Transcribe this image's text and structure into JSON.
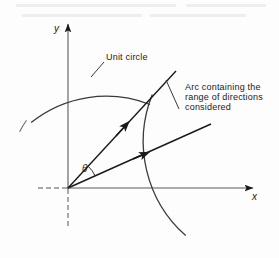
{
  "figure": {
    "type": "geometry-diagram",
    "background_color": "#fdfdfd",
    "stroke_color": "#1a1a1a",
    "width": 279,
    "height": 258,
    "origin": {
      "x": 68,
      "y": 188
    }
  },
  "axes": {
    "x_label": "x",
    "y_label": "y",
    "x_axis": {
      "from_x": 38,
      "to_x": 258,
      "y": 188,
      "dashed_left_of_origin": true,
      "arrow": "right"
    },
    "y_axis": {
      "x": 68,
      "from_y": 225,
      "to_y": 18,
      "dashed_below_origin": true,
      "arrow": "up"
    }
  },
  "angle": {
    "symbol": "θ",
    "between_rays": [
      "ray-upper",
      "ray-lower"
    ],
    "vertex": {
      "x": 68,
      "y": 188
    }
  },
  "rays": [
    {
      "name": "ray-upper",
      "from": {
        "x": 68,
        "y": 188
      },
      "to": {
        "x": 176,
        "y": 71
      },
      "arrow_at": {
        "x": 123,
        "y": 135
      },
      "angle_deg": 47
    },
    {
      "name": "ray-lower",
      "from": {
        "x": 68,
        "y": 188
      },
      "to": {
        "x": 211,
        "y": 124
      },
      "arrow_at": {
        "x": 141,
        "y": 156
      },
      "angle_deg": 24
    }
  ],
  "arcs": [
    {
      "name": "unit-circle-arc",
      "label": "Unit circle",
      "center": {
        "x": 68,
        "y": 188
      },
      "radius": 120,
      "start_angle_deg": 152,
      "end_angle_deg": 47,
      "leader_from": {
        "x": 103,
        "y": 63
      },
      "leader_to": {
        "x": 92,
        "y": 76
      }
    },
    {
      "name": "range-of-directions-arc",
      "label_lines": [
        "Arc containing the",
        "range of directions",
        "considered"
      ],
      "center": {
        "x": 68,
        "y": 188
      },
      "radius": 126,
      "start_angle_deg": 48,
      "end_angle_deg": -22,
      "leader_from": {
        "x": 178,
        "y": 108
      },
      "leader_to": {
        "x": 166,
        "y": 81
      }
    }
  ],
  "labels": {
    "unit_circle": "Unit circle",
    "arc_note_line_1": "Arc containing the",
    "arc_note_line_2": "range of directions",
    "arc_note_line_3": "considered",
    "x_axis": "x",
    "y_axis": "y",
    "theta": "θ"
  }
}
